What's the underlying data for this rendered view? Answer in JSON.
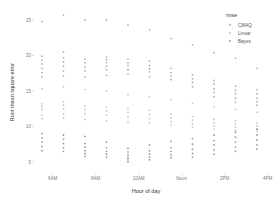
{
  "chart_data": {
    "type": "scatter",
    "title": "",
    "xlabel": "Hour of day",
    "ylabel": "Root mean square error",
    "x_tick_labels": [
      "6AM",
      "8AM",
      "10AM",
      "Noon",
      "2PM",
      "4PM"
    ],
    "x_tick_positions": [
      6.5,
      8.5,
      10.5,
      12.5,
      14.5,
      16.5
    ],
    "categories": [
      "6AM",
      "7AM",
      "8AM",
      "9AM",
      "10AM",
      "11AM",
      "Noon",
      "1PM",
      "2PM",
      "3PM",
      "4PM",
      "5PM"
    ],
    "y_ticks": [
      5,
      10,
      15,
      20,
      25
    ],
    "ylim": [
      3.5,
      26.5
    ],
    "grid": false,
    "legend": {
      "title": "rmse",
      "position": "right-top",
      "entries": [
        "CMAQ",
        "Linear",
        "Bayes"
      ]
    },
    "series": [
      {
        "name": "CMAQ",
        "color": "#b0b0b0",
        "points": [
          [
            6,
            [
              24.8,
              19.9,
              19.3,
              18.8,
              18.2,
              17.6,
              17.0
            ]
          ],
          [
            7,
            [
              25.7,
              20.5,
              19.7,
              19.1,
              18.5,
              17.8,
              17.1
            ]
          ],
          [
            8,
            [
              25.0,
              19.5,
              19.0,
              18.4,
              17.8,
              17.0
            ]
          ],
          [
            9,
            [
              25.0,
              19.8,
              19.4,
              19.0,
              18.5,
              18.0,
              17.2
            ]
          ],
          [
            10,
            [
              24.3,
              19.5,
              19.0,
              18.6,
              18.0,
              17.4
            ]
          ],
          [
            11,
            [
              23.6,
              19.2,
              18.6,
              18.1,
              17.7,
              17.0
            ]
          ],
          [
            12,
            [
              22.4,
              18.2,
              17.6,
              17.1,
              16.6
            ]
          ],
          [
            13,
            [
              21.5,
              17.3,
              16.7,
              16.2,
              15.6
            ]
          ],
          [
            14,
            [
              20.4,
              16.5,
              16.0,
              15.3,
              14.8,
              14.2
            ]
          ],
          [
            15,
            [
              19.6,
              15.7,
              15.1,
              14.6,
              14.0,
              13.4
            ]
          ],
          [
            16,
            [
              18.2,
              15.2,
              14.6,
              14.0,
              13.5,
              13.0
            ]
          ],
          [
            17,
            [
              17.6,
              14.7,
              14.2,
              13.6,
              13.1,
              12.6
            ]
          ]
        ]
      },
      {
        "name": "Linear",
        "color": "#c4c4c4",
        "points": [
          [
            6,
            [
              15.3,
              13.2,
              12.8,
              12.4,
              11.6,
              11.1
            ]
          ],
          [
            7,
            [
              15.6,
              13.5,
              13.0,
              12.5,
              11.8,
              11.2
            ]
          ],
          [
            8,
            [
              15.2,
              12.9,
              12.4,
              11.8,
              11.0
            ]
          ],
          [
            9,
            [
              15.0,
              12.7,
              12.2,
              11.6,
              10.8
            ]
          ],
          [
            10,
            [
              14.5,
              12.5,
              12.0,
              11.4,
              10.6
            ]
          ],
          [
            11,
            [
              14.2,
              12.3,
              11.7,
              11.1,
              10.5
            ]
          ],
          [
            12,
            [
              13.8,
              11.7,
              11.2,
              10.7,
              10.2
            ]
          ],
          [
            13,
            [
              13.3,
              11.4,
              10.9,
              10.4,
              9.9
            ]
          ],
          [
            14,
            [
              12.8,
              11.0,
              10.5,
              10.1,
              9.6
            ]
          ],
          [
            15,
            [
              12.4,
              10.8,
              10.3,
              9.9,
              9.5
            ]
          ],
          [
            16,
            [
              12.0,
              10.5,
              10.1,
              9.7,
              9.3
            ]
          ],
          [
            17,
            [
              11.7,
              10.3,
              9.9,
              9.5,
              9.1
            ]
          ]
        ]
      },
      {
        "name": "Bayes",
        "color": "#9a9a9a",
        "points": [
          [
            6,
            [
              9.0,
              8.4,
              7.8,
              7.2,
              6.6
            ]
          ],
          [
            7,
            [
              8.8,
              8.2,
              7.6,
              7.0,
              6.5
            ]
          ],
          [
            8,
            [
              8.6,
              7.6,
              7.1,
              6.6,
              6.2,
              5.8
            ]
          ],
          [
            9,
            [
              7.8,
              7.0,
              6.5,
              6.1,
              5.7
            ]
          ],
          [
            10,
            [
              6.9,
              6.4,
              6.0,
              5.6,
              5.3,
              5.0
            ]
          ],
          [
            11,
            [
              7.4,
              6.6,
              6.1,
              5.7,
              5.3
            ]
          ],
          [
            12,
            [
              7.9,
              7.0,
              6.5,
              6.0,
              5.6
            ]
          ],
          [
            13,
            [
              8.3,
              7.5,
              6.8,
              6.2,
              5.7
            ]
          ],
          [
            14,
            [
              8.8,
              8.0,
              7.4,
              6.7,
              6.1
            ]
          ],
          [
            15,
            [
              9.2,
              8.5,
              7.8,
              7.1,
              6.5
            ]
          ],
          [
            16,
            [
              9.6,
              8.8,
              8.1,
              7.4,
              6.8
            ]
          ],
          [
            17,
            [
              10.0,
              9.2,
              8.5,
              7.8,
              7.1
            ]
          ]
        ]
      }
    ]
  }
}
